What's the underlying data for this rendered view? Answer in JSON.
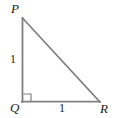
{
  "figure": {
    "type": "right-triangle-diagram",
    "background_color": "#ffffff",
    "stroke_color": "#808080",
    "label_color": "#1a1a1a",
    "width": 114,
    "height": 118,
    "vertices": [
      {
        "name": "P",
        "label": "P",
        "x": 22,
        "y": 18
      },
      {
        "name": "Q",
        "label": "Q",
        "x": 22,
        "y": 102
      },
      {
        "name": "R",
        "label": "R",
        "x": 100,
        "y": 102
      }
    ],
    "sides": [
      {
        "name": "PQ",
        "label": "1",
        "from": "P",
        "to": "Q"
      },
      {
        "name": "QR",
        "label": "1",
        "from": "Q",
        "to": "R"
      },
      {
        "name": "PR",
        "label": "",
        "from": "P",
        "to": "R"
      }
    ],
    "right_angle": {
      "at_vertex": "Q",
      "marker": "square",
      "size": 8
    },
    "labels": {
      "vertex_p": "P",
      "vertex_q": "Q",
      "vertex_r": "R",
      "side_pq": "1",
      "side_qr": "1"
    }
  }
}
